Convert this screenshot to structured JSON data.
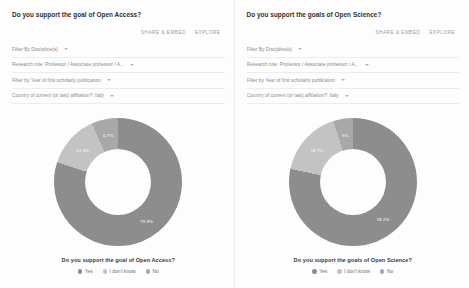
{
  "panels": [
    {
      "title": "Do you support the goal of Open Access?",
      "toolbar": {
        "share": "SHARE & EMBED",
        "explore": "EXPLORE"
      },
      "filters": [
        "Filter By Discipline(s)",
        "Research role: Professor / Associate professor / A...",
        "Filter by Year of first scholarly publication",
        "Country of current (or last) affiliation?: Italy"
      ],
      "caption": "Do you support the goal of Open Access?",
      "chart_data": {
        "type": "pie",
        "title": "Do you support the goal of Open Access?",
        "categories": [
          "Yes",
          "I don't know",
          "No"
        ],
        "values": [
          79.9,
          13.3,
          6.7
        ],
        "labels": [
          "79.9%",
          "13.3%",
          "6.7%"
        ],
        "colors": [
          "#8d8d8d",
          "#c3c3c3",
          "#a8a8a8"
        ],
        "legend_position": "bottom",
        "grid": false,
        "xlabel": "",
        "ylabel": ""
      }
    },
    {
      "title": "Do you support the goals of Open Science?",
      "toolbar": {
        "share": "SHARE & EMBED",
        "explore": "EXPLORE"
      },
      "filters": [
        "Filter By Discipline(s)",
        "Research role: Professor / Associate professor / A...",
        "Filter by Year of first scholarly publication",
        "Country of current (or last) affiliation?: Italy"
      ],
      "caption": "Do you support the goals of Open Science?",
      "chart_data": {
        "type": "pie",
        "title": "Do you support the goals of Open Science?",
        "categories": [
          "Yes",
          "I don't know",
          "No"
        ],
        "values": [
          78.2,
          16.7,
          5.0
        ],
        "labels": [
          "78.2%",
          "16.7%",
          "5%"
        ],
        "colors": [
          "#8d8d8d",
          "#c3c3c3",
          "#a8a8a8"
        ],
        "legend_position": "bottom",
        "grid": false,
        "xlabel": "",
        "ylabel": ""
      }
    }
  ],
  "legend_labels": [
    "Yes",
    "I don't know",
    "No"
  ],
  "legend_colors": [
    "#8d8d8d",
    "#c3c3c3",
    "#a8a8a8"
  ],
  "caret_icon": "chevron-down-icon"
}
